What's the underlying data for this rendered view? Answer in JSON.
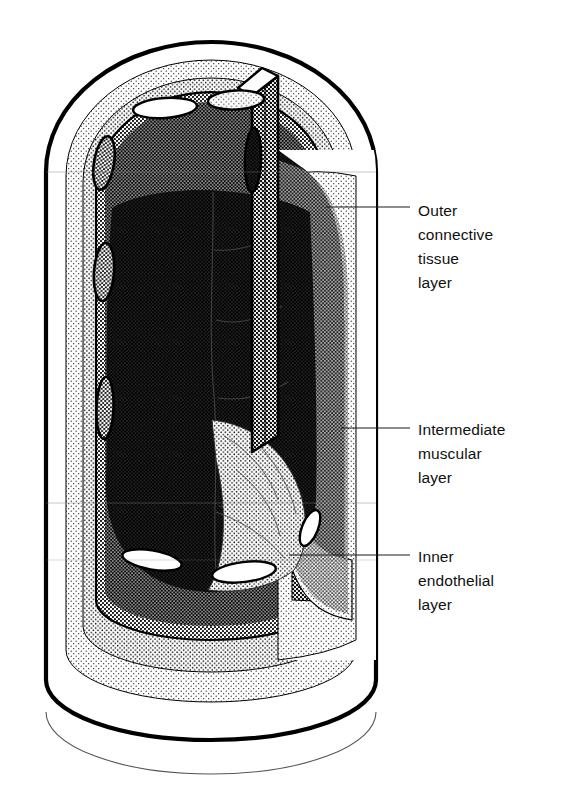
{
  "figure": {
    "name": "blood-vessel-cutaway-diagram",
    "background_color": "#ffffff",
    "line_color": "#000000"
  },
  "labels": [
    {
      "id": "outer-connective-tissue-layer",
      "lines": [
        "Outer",
        "connective",
        "tissue",
        "layer"
      ],
      "text_x": 418,
      "text_y": 216,
      "line_height": 24,
      "leader": {
        "x1": 326,
        "y1": 207,
        "x2": 410,
        "y2": 207
      }
    },
    {
      "id": "intermediate-muscular-layer",
      "lines": [
        "Intermediate",
        "muscular",
        "layer"
      ],
      "text_x": 418,
      "text_y": 435,
      "line_height": 24,
      "leader": {
        "x1": 341,
        "y1": 428,
        "x2": 410,
        "y2": 428
      }
    },
    {
      "id": "inner-endothelial-layer",
      "lines": [
        "Inner",
        "endothelial",
        "layer"
      ],
      "text_x": 418,
      "text_y": 562,
      "line_height": 24,
      "leader": {
        "x1": 289,
        "y1": 555,
        "x2": 410,
        "y2": 555
      }
    }
  ],
  "layers": [
    {
      "id": "outer-connective-tissue",
      "shade": "light-stipple",
      "color": "#efefef"
    },
    {
      "id": "intermediate-muscular",
      "shade": "medium-stipple",
      "color": "#c6c6c6"
    },
    {
      "id": "inner-endothelial",
      "shade": "fine-stipple",
      "color": "#dddddd"
    },
    {
      "id": "lumen",
      "shade": "dark-halftone",
      "color": "#1a1a1a"
    }
  ],
  "geometry": {
    "outer_left": 46,
    "outer_right": 376,
    "top_apex": 44,
    "bottom_base": 735,
    "cut_face_x": 278,
    "cylinder_shoulder_y": 503
  }
}
